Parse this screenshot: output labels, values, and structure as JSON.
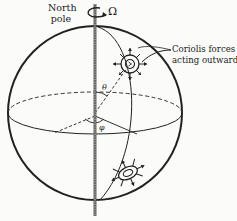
{
  "figure": {
    "labels": {
      "north_pole_line1": "North",
      "north_pole_line2": "pole",
      "rotation": "Ω",
      "coriolis_line1": "Coriolis forces",
      "coriolis_line2": "acting outwards",
      "colatitude": "θ",
      "longitude": "φ"
    },
    "colors": {
      "ink": "#222222",
      "axis": "#555555",
      "background": "#fbfbfa"
    },
    "elements": {
      "sphere": {
        "cx": 95,
        "cy": 113,
        "r": 87
      },
      "equator": {
        "cx": 95,
        "cy": 113,
        "rx": 87,
        "ry": 21
      },
      "axis": {
        "x": 95,
        "y1": 4,
        "y2": 216
      },
      "vortices": [
        {
          "name": "northern-vortex",
          "cx": 130,
          "cy": 64
        },
        {
          "name": "southern-vortex",
          "cx": 128,
          "cy": 173
        }
      ]
    }
  }
}
